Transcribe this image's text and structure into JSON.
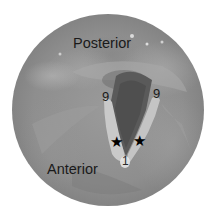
{
  "image": {
    "description": "Circular grayscale endoscopic (laryngoscopic) view of the glottis with orientation labels",
    "labels": {
      "posterior": "Posterior",
      "anterior": "Anterior",
      "left_marker": "9",
      "right_marker": "9",
      "commissure_marker": "1"
    },
    "markers": {
      "star_left": "★",
      "star_right": "★"
    },
    "colors": {
      "background": "#ffffff",
      "tissue_mid": "#8e8e8e",
      "glottic_gap": "#555555",
      "vocal_fold": "#c8c8c8",
      "text": "#1a1a1a"
    }
  }
}
